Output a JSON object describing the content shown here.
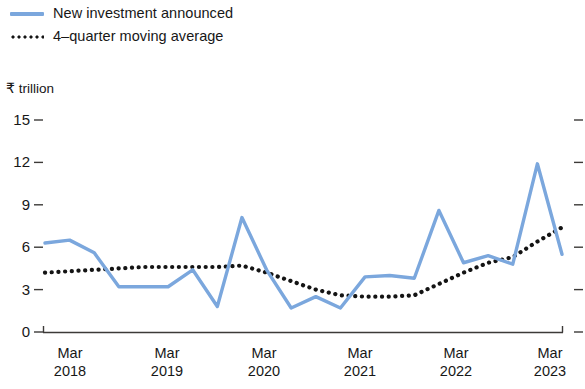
{
  "legend": {
    "items": [
      {
        "label": "New investment announced",
        "marker": "solid-line-swatch",
        "color": "#7ba7dd"
      },
      {
        "label": "4–quarter moving average",
        "marker": "dotted-line-swatch",
        "color": "#141414"
      }
    ]
  },
  "axis": {
    "y_unit_label": "₹ trillion",
    "y_ticks": [
      "0",
      "3",
      "6",
      "9",
      "12",
      "15"
    ],
    "x_ticks": [
      {
        "month": "Mar",
        "year": "2018"
      },
      {
        "month": "Mar",
        "year": "2019"
      },
      {
        "month": "Mar",
        "year": "2020"
      },
      {
        "month": "Mar",
        "year": "2021"
      },
      {
        "month": "Mar",
        "year": "2022"
      },
      {
        "month": "Mar",
        "year": "2023"
      }
    ]
  },
  "chart_data": {
    "type": "line",
    "title": "",
    "subtitle": "",
    "xlabel": "",
    "ylabel": "₹ trillion",
    "ylim": [
      0,
      15
    ],
    "yticks": [
      0,
      3,
      6,
      9,
      12,
      15
    ],
    "grid": false,
    "legend_position": "top-left",
    "x": [
      "Mar 2018",
      "Jun 2018",
      "Sep 2018",
      "Dec 2018",
      "Mar 2019",
      "Jun 2019",
      "Sep 2019",
      "Dec 2019",
      "Mar 2020",
      "Jun 2020",
      "Sep 2020",
      "Dec 2020",
      "Mar 2021",
      "Jun 2021",
      "Sep 2021",
      "Dec 2021",
      "Mar 2022",
      "Jun 2022",
      "Sep 2022",
      "Dec 2022",
      "Mar 2023",
      "Jun 2023"
    ],
    "series": [
      {
        "name": "New investment announced",
        "color": "#7ba7dd",
        "style": "solid",
        "values": [
          6.3,
          6.5,
          5.6,
          3.2,
          3.2,
          3.2,
          4.4,
          1.8,
          8.1,
          4.4,
          1.7,
          2.5,
          1.7,
          3.9,
          4.0,
          3.8,
          8.6,
          4.9,
          5.4,
          4.8,
          11.9,
          5.5
        ]
      },
      {
        "name": "4–quarter moving average",
        "color": "#141414",
        "style": "dotted",
        "values": [
          4.2,
          4.3,
          4.4,
          4.5,
          4.6,
          4.6,
          4.6,
          4.6,
          4.7,
          4.2,
          3.6,
          3.0,
          2.6,
          2.5,
          2.5,
          2.6,
          3.4,
          4.2,
          4.9,
          5.3,
          6.4,
          7.4
        ]
      }
    ]
  },
  "colors": {
    "series_blue": "#7ba7dd",
    "series_black": "#141414",
    "axis": "#3c3a38",
    "text": "#171717",
    "background": "#ffffff"
  }
}
